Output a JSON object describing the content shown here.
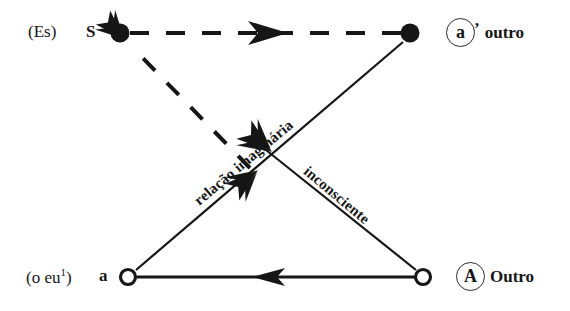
{
  "diagram": {
    "background_color": "#ffffff",
    "ink_color": "#161616",
    "nodes": [
      {
        "id": "S",
        "role": "subject",
        "marker": "filled-dot",
        "x": 120,
        "y": 33,
        "left_paren_label": "(Es)",
        "letter_label": "S"
      },
      {
        "id": "a-prime",
        "role": "other-imaginary",
        "marker": "filled-dot",
        "x": 410,
        "y": 33,
        "circled_letter": "a",
        "prime": "’",
        "word": "outro"
      },
      {
        "id": "a",
        "role": "ego",
        "marker": "open-circle",
        "x": 128,
        "y": 277,
        "left_paren_label": "(o eu¹)",
        "letter_label": "a",
        "paren_text": "(o eu",
        "paren_sup": "1",
        "paren_close": ")"
      },
      {
        "id": "A",
        "role": "big-other",
        "marker": "open-circle",
        "x": 423,
        "y": 277,
        "circled_letter": "A",
        "word": "Outro"
      }
    ],
    "edges": [
      {
        "id": "S-to-aprime",
        "from": "S",
        "to": "a-prime",
        "style": "dashed",
        "arrow": "mid-right",
        "label": ""
      },
      {
        "id": "a-to-S",
        "from": "a",
        "to": "S",
        "style": "dashed",
        "arrow": "head-at-S",
        "label": ""
      },
      {
        "id": "aprime-to-a",
        "from": "a-prime",
        "to": "a",
        "style": "solid",
        "arrow": "mid-down-left",
        "label": "relação imaginária"
      },
      {
        "id": "A-to-S",
        "from": "A",
        "to": "S",
        "style": "solid",
        "arrow": "mid-up-left",
        "label": "inconsciente"
      },
      {
        "id": "A-to-a",
        "from": "A",
        "to": "a",
        "style": "solid",
        "arrow": "mid-left",
        "label": ""
      }
    ],
    "edge_labels": {
      "imaginary_relation": "relação imaginária",
      "unconscious": "inconsciente"
    }
  }
}
